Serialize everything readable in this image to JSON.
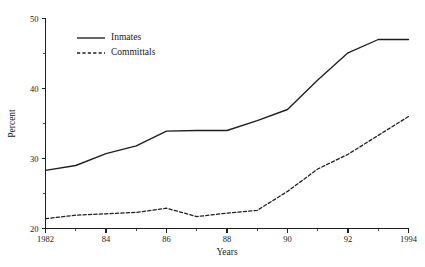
{
  "chart_data": {
    "type": "line",
    "title": "",
    "subtitle": "",
    "xlabel": "Years",
    "ylabel": "Percent",
    "xlim": [
      1982,
      1994
    ],
    "ylim": [
      20,
      50
    ],
    "grid": false,
    "legend_position": "top-left",
    "x": [
      1982,
      1983,
      1984,
      1985,
      1986,
      1987,
      1988,
      1989,
      1990,
      1991,
      1992,
      1993,
      1994
    ],
    "x_tick_labels_major": [
      "1982",
      "84",
      "86",
      "88",
      "90",
      "92",
      "1994"
    ],
    "x_ticks_major": [
      1982,
      1984,
      1986,
      1988,
      1990,
      1992,
      1994
    ],
    "x_ticks_minor": [
      1983,
      1985,
      1987,
      1989,
      1991,
      1993
    ],
    "y_ticks_major": [
      20,
      30,
      40,
      50
    ],
    "y_tick_labels_major": [
      "20",
      "30",
      "40",
      "50"
    ],
    "y_ticks_minor": [
      25,
      35,
      45
    ],
    "series": [
      {
        "name": "Inmates",
        "style": "solid",
        "color": "#1f1f1f",
        "values": [
          28.3,
          29.0,
          30.7,
          31.8,
          33.9,
          34.0,
          34.0,
          35.4,
          37.0,
          41.2,
          45.1,
          47.0,
          47.0
        ]
      },
      {
        "name": "Committals",
        "style": "dashed",
        "color": "#1f1f1f",
        "values": [
          21.4,
          21.9,
          22.1,
          22.3,
          22.9,
          21.7,
          22.2,
          22.6,
          25.3,
          28.5,
          30.6,
          33.3,
          36.0
        ]
      }
    ],
    "annotations": []
  },
  "legend": {
    "entries": [
      {
        "label": "Inmates"
      },
      {
        "label": "Committals"
      }
    ]
  },
  "axis": {
    "x_title": "Years",
    "y_title": "Percent"
  }
}
